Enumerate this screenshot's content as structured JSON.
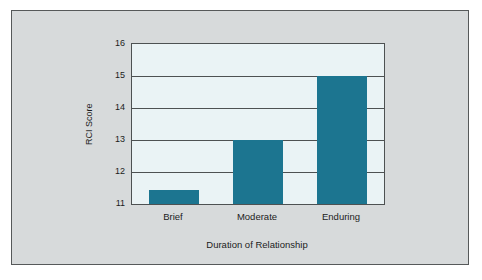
{
  "figure": {
    "background_color": "#d7dadb",
    "border_color": "#56595a",
    "page_background": "#ffffff"
  },
  "chart_data": {
    "type": "bar",
    "title": "",
    "subtitle": "",
    "xlabel": "Duration of Relationship",
    "ylabel": "RCI Score",
    "categories": [
      "Brief",
      "Moderate",
      "Enduring"
    ],
    "values": [
      11.45,
      13,
      15
    ],
    "series": [
      {
        "name": "RCI Score",
        "values": [
          11.45,
          13,
          15
        ]
      }
    ],
    "ylim": [
      11,
      16
    ],
    "yticks": [
      11,
      12,
      13,
      14,
      15,
      16
    ],
    "ytick_labels": [
      "11",
      "12",
      "13",
      "14",
      "15",
      "16"
    ],
    "xtick_labels": [
      "Brief",
      "Moderate",
      "Enduring"
    ],
    "grid": true,
    "grid_axis": "y",
    "legend": false,
    "legend_position": "none",
    "bar_color": "#1c7590",
    "plot_background": "#eaf3f5",
    "axis_color": "#4d5152",
    "annotations": []
  }
}
